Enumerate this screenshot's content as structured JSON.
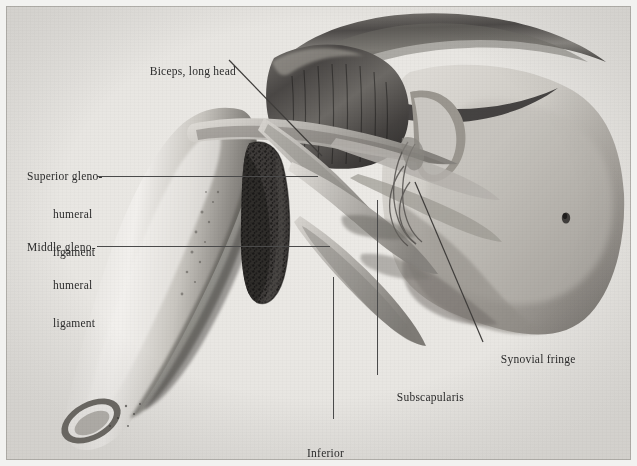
{
  "figure": {
    "domain": "anatomical-illustration",
    "background_color": "#e9e7e3",
    "ink_color": "#2b2b2b",
    "leader_line_color": "#4a4a4a",
    "width": 637,
    "height": 466
  },
  "labels": [
    {
      "id": "biceps-long-head",
      "text": "Biceps, long head",
      "lines": [
        "Biceps, long head"
      ],
      "x": 131,
      "y": 52,
      "align": "left",
      "leader": {
        "type": "diagonal",
        "x1": 229,
        "y1": 60,
        "x2": 322,
        "y2": 156
      }
    },
    {
      "id": "superior-glenohumeral-ligament",
      "text": "Superior gleno-humeral ligament",
      "lines": [
        "Superior gleno-",
        "humeral",
        "ligament"
      ],
      "x": 27,
      "y": 145,
      "align": "left",
      "leader": {
        "type": "horizontal",
        "x1": 97,
        "y1": 176,
        "x2": 318,
        "y2": 176
      }
    },
    {
      "id": "middle-glenohumeral-ligament",
      "text": "Middle gleno-humeral ligament",
      "lines": [
        "Middle gleno-",
        "humeral",
        "ligament"
      ],
      "x": 27,
      "y": 216,
      "align": "left",
      "leader": {
        "type": "horizontal",
        "x1": 97,
        "y1": 246,
        "x2": 330,
        "y2": 246
      }
    },
    {
      "id": "synovial-fringe",
      "text": "Synovial fringe",
      "lines": [
        "Synovial fringe"
      ],
      "x": 482,
      "y": 341,
      "align": "left",
      "leader": {
        "type": "diagonal",
        "x1": 415,
        "y1": 182,
        "x2": 483,
        "y2": 342
      }
    },
    {
      "id": "subscapularis",
      "text": "Subscapularis",
      "lines": [
        "Subscapularis"
      ],
      "x": 378,
      "y": 379,
      "align": "left",
      "leader": {
        "type": "vertical",
        "x1": 377,
        "y1": 200,
        "x2": 377,
        "y2": 375
      }
    },
    {
      "id": "inferior-glenohumeral-ligament",
      "text": "Inferior gleno-humeral ligament",
      "lines": [
        "Inferior",
        "gleno-humeral",
        "ligament"
      ],
      "x": 307,
      "y": 423,
      "align": "left",
      "leader": {
        "type": "vertical",
        "x1": 333,
        "y1": 277,
        "x2": 333,
        "y2": 419
      }
    }
  ],
  "structures": [
    {
      "id": "humeral-shaft",
      "name": "Humeral shaft"
    },
    {
      "id": "humeral-head",
      "name": "Head of humerus"
    },
    {
      "id": "glenoid-cavity",
      "name": "Glenoid cavity (stippled articular surface)"
    },
    {
      "id": "acromion",
      "name": "Acromion / coracoacromial arch"
    },
    {
      "id": "coracoid-process",
      "name": "Coracoid process"
    },
    {
      "id": "scapula-body",
      "name": "Body of scapula"
    },
    {
      "id": "capsule-reflection",
      "name": "Reflected joint capsule"
    }
  ]
}
